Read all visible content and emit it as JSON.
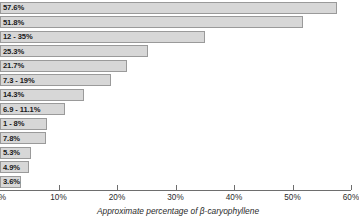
{
  "chart_data": {
    "type": "bar",
    "orientation": "horizontal",
    "title": "",
    "subtitle": "",
    "xlabel": "Approximate percentage of β-caryophyllene",
    "ylabel": "",
    "xlim": [
      0,
      60
    ],
    "grid": false,
    "legend": null,
    "axis_tick_labels": [
      "0%",
      "10%",
      "20%",
      "30%",
      "40%",
      "50%",
      "60%"
    ],
    "axis_tick_values": [
      0,
      10,
      20,
      30,
      40,
      50,
      60
    ],
    "bar_color": "#d7d7d7",
    "bar_border_color": "#9a9a9a",
    "categories": [
      "bar-1",
      "bar-2",
      "bar-3",
      "bar-4",
      "bar-5",
      "bar-6",
      "bar-7",
      "bar-8",
      "bar-9",
      "bar-10",
      "bar-11",
      "bar-12",
      "bar-13"
    ],
    "values": [
      57.6,
      51.8,
      35,
      25.3,
      21.7,
      19,
      14.3,
      11.1,
      8,
      7.8,
      5.3,
      4.9,
      3.6
    ],
    "data_labels": [
      "57.6%",
      "51.8%",
      "12 - 35%",
      "25.3%",
      "21.7%",
      "7.3 - 19%",
      "14.3%",
      "6.9 - 11.1%",
      "1 - 8%",
      "7.8%",
      "5.3%",
      "4.9%",
      "3.6%"
    ]
  }
}
